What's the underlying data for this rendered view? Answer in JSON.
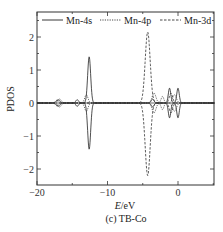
{
  "chart_data": {
    "type": "line",
    "title": "",
    "caption": "(c) TB-Co",
    "xlabel_italic": "E",
    "xlabel_unit": "/eV",
    "ylabel": "PDOS",
    "xlim": [
      -20,
      5.2
    ],
    "ylim": [
      -2.5,
      2.65
    ],
    "xticks": [
      -20,
      -10,
      0
    ],
    "xtick_labels": [
      "−20",
      "−10",
      "0"
    ],
    "xminor": [
      -15,
      -5,
      5
    ],
    "yticks": [
      2,
      1,
      0,
      -1,
      -2
    ],
    "ytick_labels": [
      "2",
      "1",
      "0",
      "−1",
      "−2"
    ],
    "yminor": [
      2.5,
      1.5,
      0.5,
      -0.5,
      -1.5,
      -2.5
    ],
    "grid": false,
    "legend_position": "top",
    "series": [
      {
        "name": "Mn-4s",
        "style": "solid",
        "color": "#222222",
        "peaks": [
          {
            "x": -17.0,
            "up": 0.1,
            "down": -0.1,
            "width": 0.6
          },
          {
            "x": -14.3,
            "up": 0.1,
            "down": -0.1,
            "width": 0.5
          },
          {
            "x": -12.6,
            "up": 1.4,
            "down": -1.4,
            "width": 0.55
          },
          {
            "x": -3.6,
            "up": 0.12,
            "down": -0.12,
            "width": 0.5
          },
          {
            "x": -1.2,
            "up": 0.45,
            "down": -0.45,
            "width": 0.45
          },
          {
            "x": 0.0,
            "up": 0.45,
            "down": -0.45,
            "width": 0.45
          }
        ]
      },
      {
        "name": "Mn-4p",
        "style": "dotted",
        "color": "#333333",
        "peaks": [
          {
            "x": -16.8,
            "up": 0.12,
            "down": -0.12,
            "width": 0.6
          },
          {
            "x": -13.0,
            "up": 0.25,
            "down": -0.25,
            "width": 0.6
          },
          {
            "x": -3.4,
            "up": 0.3,
            "down": -0.3,
            "width": 0.7
          },
          {
            "x": -2.2,
            "up": 0.2,
            "down": -0.2,
            "width": 0.5
          },
          {
            "x": -0.5,
            "up": 0.25,
            "down": -0.25,
            "width": 0.7
          }
        ]
      },
      {
        "name": "Mn-3d",
        "style": "dashed",
        "color": "#333333",
        "peaks": [
          {
            "x": -17.2,
            "up": 0.08,
            "down": -0.08,
            "width": 0.5
          },
          {
            "x": -4.3,
            "up": 2.15,
            "down": -2.2,
            "width": 0.9
          },
          {
            "x": -1.0,
            "up": 0.3,
            "down": -0.3,
            "width": 0.6
          }
        ]
      }
    ]
  }
}
